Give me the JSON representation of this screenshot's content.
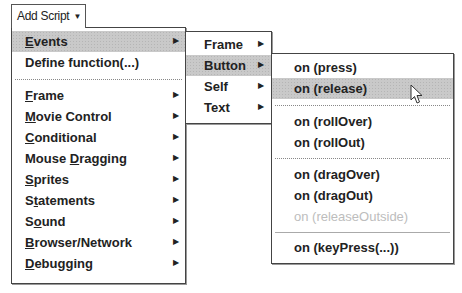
{
  "toolbar": {
    "add_script_label": "Add Script",
    "dropdown_icon": "caret-down-icon"
  },
  "main_menu": {
    "items": [
      {
        "label": "Events",
        "ul": "E",
        "rest": "vents",
        "submenu": true,
        "highlighted": true
      },
      {
        "label": "Define function(...)",
        "submenu": false
      },
      {
        "label": "Frame",
        "ul": "F",
        "rest": "rame",
        "submenu": true
      },
      {
        "label": "Movie Control",
        "ul": "M",
        "rest": "ovie Control",
        "submenu": true
      },
      {
        "label": "Conditional",
        "ul": "C",
        "rest": "onditional",
        "submenu": true
      },
      {
        "label": "Mouse Dragging",
        "pre": "Mouse ",
        "ul": "D",
        "rest": "ragging",
        "submenu": true
      },
      {
        "label": "Sprites",
        "ul": "S",
        "rest": "prites",
        "submenu": true
      },
      {
        "label": "Statements",
        "pre": "S",
        "ul": "t",
        "rest": "atements",
        "submenu": true
      },
      {
        "label": "Sound",
        "pre": "S",
        "ul": "o",
        "rest": "und",
        "submenu": true
      },
      {
        "label": "Browser/Network",
        "ul": "B",
        "rest": "rowser/Network",
        "submenu": true
      },
      {
        "label": "Debugging",
        "ul": "D",
        "rest": "ebugging",
        "submenu": true
      }
    ]
  },
  "events_menu": {
    "items": [
      {
        "label": "Frame",
        "submenu": true
      },
      {
        "label": "Button",
        "submenu": true,
        "highlighted": true
      },
      {
        "label": "Self",
        "submenu": true
      },
      {
        "label": "Text",
        "submenu": true
      }
    ]
  },
  "button_menu": {
    "items": [
      {
        "label": "on (press)"
      },
      {
        "label": "on (release)",
        "highlighted": true
      },
      {
        "label": "on (rollOver)"
      },
      {
        "label": "on (rollOut)"
      },
      {
        "label": "on (dragOver)"
      },
      {
        "label": "on (dragOut)"
      },
      {
        "label": "on (releaseOutside)",
        "disabled": true
      },
      {
        "label": "on (keyPress(...))"
      }
    ]
  },
  "submenu_arrow_icon": "triangle-right-icon",
  "pointer": "arrow-cursor-icon"
}
